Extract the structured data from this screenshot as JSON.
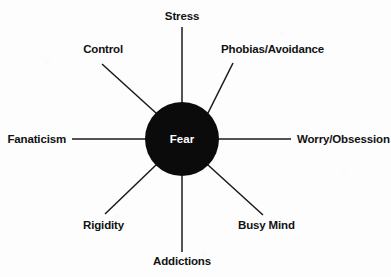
{
  "diagram": {
    "type": "radial-hub-and-spoke",
    "spoke_count": 8,
    "colors": {
      "hub_fill": "#0b0b0b",
      "hub_text": "#ffffff",
      "line": "#1a1a1a",
      "label_text": "#121212",
      "background": "#fdfdfd"
    },
    "hub": {
      "label": "Fear",
      "cx": 182,
      "cy": 139,
      "r": 37
    },
    "nodes": [
      {
        "id": "stress",
        "label": "Stress",
        "direction": "N",
        "angle_deg": 90,
        "label_x": 182,
        "label_y": 20,
        "anchor": "middle",
        "line": {
          "x1": 182,
          "y1": 27,
          "x2": 182,
          "y2": 102
        }
      },
      {
        "id": "phobias-avoidance",
        "label": "Phobias/Avoidance",
        "direction": "NE",
        "angle_deg": 45,
        "label_x": 221,
        "label_y": 53,
        "anchor": "start",
        "line": {
          "x1": 233,
          "y1": 63,
          "x2": 208,
          "y2": 113
        }
      },
      {
        "id": "worry-obsession",
        "label": "Worry/Obsession",
        "direction": "E",
        "angle_deg": 0,
        "label_x": 297,
        "label_y": 143,
        "anchor": "start",
        "line": {
          "x1": 219,
          "y1": 139,
          "x2": 291,
          "y2": 139
        }
      },
      {
        "id": "busy-mind",
        "label": "Busy Mind",
        "direction": "SE",
        "angle_deg": -45,
        "label_x": 238,
        "label_y": 229,
        "anchor": "start",
        "line": {
          "x1": 208,
          "y1": 165,
          "x2": 263,
          "y2": 215
        }
      },
      {
        "id": "addictions",
        "label": "Addictions",
        "direction": "S",
        "angle_deg": -90,
        "label_x": 182,
        "label_y": 265,
        "anchor": "middle",
        "line": {
          "x1": 182,
          "y1": 176,
          "x2": 182,
          "y2": 252
        }
      },
      {
        "id": "rigidity",
        "label": "Rigidity",
        "direction": "SW",
        "angle_deg": -135,
        "label_x": 124,
        "label_y": 229,
        "anchor": "end",
        "line": {
          "x1": 156,
          "y1": 165,
          "x2": 105,
          "y2": 214
        }
      },
      {
        "id": "fanaticism",
        "label": "Fanaticism",
        "direction": "W",
        "angle_deg": 180,
        "label_x": 66,
        "label_y": 143,
        "anchor": "end",
        "line": {
          "x1": 72,
          "y1": 139,
          "x2": 146,
          "y2": 139
        }
      },
      {
        "id": "control",
        "label": "Control",
        "direction": "NW",
        "angle_deg": 135,
        "label_x": 123,
        "label_y": 53,
        "anchor": "end",
        "line": {
          "x1": 102,
          "y1": 64,
          "x2": 156,
          "y2": 113
        }
      }
    ]
  }
}
